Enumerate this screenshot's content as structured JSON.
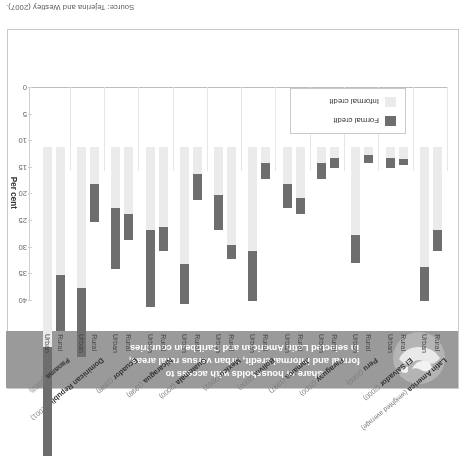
{
  "source_note": "Source: Tejerina and Westley (2007).",
  "title": {
    "line1": "Share of households with access to",
    "line2": "formal and informal credit, urban versus rural areas,",
    "line3": "in selected Latin American and Caribbean countries"
  },
  "axis": {
    "label": "Per cent",
    "ticks": [
      "0",
      "5",
      "10",
      "15",
      "20",
      "25",
      "30",
      "35",
      "40"
    ]
  },
  "legend": {
    "formal_label": "Formal credit",
    "informal_label": "Informal credit",
    "formal_color": "#6e6e6e",
    "informal_color": "#ebebeb"
  },
  "area_labels": {
    "rural": "Rural",
    "urban": "Urban"
  },
  "chart_data": {
    "type": "bar",
    "title": "Share of households with access to formal and informal credit, urban versus rural areas, in selected Latin American and Caribbean countries",
    "xlabel": "",
    "ylabel": "Per cent",
    "ylim": [
      0,
      40
    ],
    "yticks": [
      0,
      5,
      10,
      15,
      20,
      25,
      30,
      35,
      40
    ],
    "grid": false,
    "legend_position": "inside-lower-left",
    "stacked": true,
    "series": [
      {
        "name": "Formal credit",
        "color": "#6e6e6e"
      },
      {
        "name": "Informal credit",
        "color": "#ebebeb"
      }
    ],
    "categories": [
      "Latin America (weighted average)",
      "El Salvador (2000)",
      "Peru (2000)",
      "Paraguay (2000)",
      "Jamaica (1997)",
      "Bolivia (2000)",
      "Mexico (2002)",
      "Guatemala (2000)",
      "Nicaragua (1998)",
      "Ecuador (1998)",
      "Dominican Republic (2001)",
      "Panama (2003)"
    ],
    "groups": [
      {
        "country": "Latin America",
        "year": "(weighted average)",
        "bars": [
          {
            "area": "Rural",
            "formal": 4.0,
            "informal": 15.5
          },
          {
            "area": "Urban",
            "formal": 6.5,
            "informal": 22.5
          }
        ]
      },
      {
        "country": "El Salvador",
        "year": "(2000)",
        "bars": [
          {
            "area": "Rural",
            "formal": 1.2,
            "informal": 2.2
          },
          {
            "area": "Urban",
            "formal": 2.0,
            "informal": 2.0
          }
        ]
      },
      {
        "country": "Peru",
        "year": "(2000)",
        "bars": [
          {
            "area": "Rural",
            "formal": 1.5,
            "informal": 1.5
          },
          {
            "area": "Urban",
            "formal": 5.2,
            "informal": 16.5
          }
        ]
      },
      {
        "country": "Paraguay",
        "year": "(2000)",
        "bars": [
          {
            "area": "Rural",
            "formal": 2.0,
            "informal": 2.0
          },
          {
            "area": "Urban",
            "formal": 3.0,
            "informal": 3.0
          }
        ]
      },
      {
        "country": "Jamaica",
        "year": "(1997)",
        "bars": [
          {
            "area": "Rural",
            "formal": 3.0,
            "informal": 9.5
          },
          {
            "area": "Urban",
            "formal": 4.5,
            "informal": 7.0
          }
        ]
      },
      {
        "country": "Bolivia",
        "year": "(2000)",
        "bars": [
          {
            "area": "Rural",
            "formal": 3.0,
            "informal": 3.0
          },
          {
            "area": "Urban",
            "formal": 9.5,
            "informal": 19.5
          }
        ]
      },
      {
        "country": "Mexico",
        "year": "(2002)",
        "bars": [
          {
            "area": "Rural",
            "formal": 2.5,
            "informal": 18.5
          },
          {
            "area": "Urban",
            "formal": 6.5,
            "informal": 9.0
          }
        ]
      },
      {
        "country": "Guatemala",
        "year": "(2000)",
        "bars": [
          {
            "area": "Rural",
            "formal": 5.0,
            "informal": 5.0
          },
          {
            "area": "Urban",
            "formal": 7.5,
            "informal": 22.0
          }
        ]
      },
      {
        "country": "Nicaragua",
        "year": "(1998)",
        "bars": [
          {
            "area": "Rural",
            "formal": 4.5,
            "informal": 15.0
          },
          {
            "area": "Urban",
            "formal": 14.5,
            "informal": 15.5
          }
        ]
      },
      {
        "country": "Ecuador",
        "year": "(1998)",
        "bars": [
          {
            "area": "Rural",
            "formal": 5.0,
            "informal": 12.5
          },
          {
            "area": "Urban",
            "formal": 11.5,
            "informal": 11.5
          }
        ]
      },
      {
        "country": "Dominican Republic",
        "year": "(2001)",
        "bars": [
          {
            "area": "Rural",
            "formal": 7.0,
            "informal": 7.0
          },
          {
            "area": "Urban",
            "formal": 13.0,
            "informal": 26.5
          }
        ]
      },
      {
        "country": "Panama",
        "year": "(2003)",
        "bars": [
          {
            "area": "Rural",
            "formal": 10.5,
            "informal": 24.0
          },
          {
            "area": "Urban",
            "formal": 20.5,
            "informal": 37.5
          }
        ]
      }
    ]
  }
}
